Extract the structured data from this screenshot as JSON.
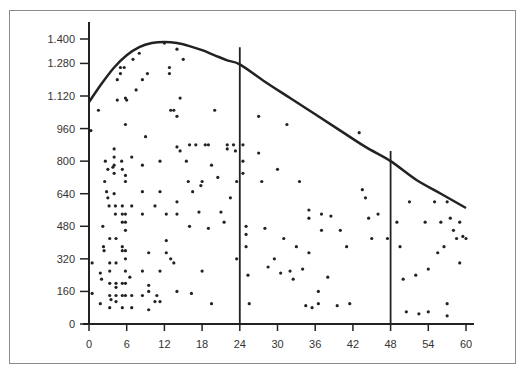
{
  "chart_data": {
    "type": "scatter",
    "title": "",
    "xlabel": "",
    "ylabel": "",
    "xlim": [
      0,
      62
    ],
    "ylim": [
      0,
      1460
    ],
    "grid": false,
    "legend": null,
    "x_ticks": [
      0,
      6,
      12,
      18,
      24,
      30,
      36,
      42,
      48,
      54,
      60
    ],
    "x_tick_labels": [
      "0",
      "6",
      "12",
      "18",
      "24",
      "30",
      "36",
      "42",
      "48",
      "54",
      "60"
    ],
    "y_ticks": [
      0,
      160,
      320,
      480,
      640,
      800,
      960,
      1120,
      1280,
      1400
    ],
    "y_tick_labels": [
      "0",
      "160",
      "320",
      "480",
      "640",
      "800",
      "960",
      "1.120",
      "1.280",
      "1.400"
    ],
    "vertical_lines": [
      {
        "x": 24,
        "y_top": 1360
      },
      {
        "x": 48,
        "y_top": 850
      }
    ],
    "envelope_curve": {
      "name": "upper envelope",
      "x": [
        0,
        2,
        4,
        6,
        8,
        10,
        12,
        14,
        16,
        18,
        20,
        22,
        24,
        28,
        32,
        36,
        40,
        44,
        48,
        52,
        56,
        60
      ],
      "y": [
        1090,
        1180,
        1260,
        1320,
        1360,
        1380,
        1385,
        1380,
        1365,
        1345,
        1320,
        1295,
        1275,
        1190,
        1110,
        1030,
        950,
        870,
        800,
        710,
        640,
        570
      ]
    },
    "points": [
      {
        "x": 0.5,
        "y": 150
      },
      {
        "x": 0.5,
        "y": 300
      },
      {
        "x": 0.3,
        "y": 950
      },
      {
        "x": 1.5,
        "y": 1050
      },
      {
        "x": 1.8,
        "y": 250
      },
      {
        "x": 1.8,
        "y": 100
      },
      {
        "x": 2,
        "y": 220
      },
      {
        "x": 2.2,
        "y": 480
      },
      {
        "x": 2.3,
        "y": 380
      },
      {
        "x": 2.4,
        "y": 360
      },
      {
        "x": 2.5,
        "y": 700
      },
      {
        "x": 2.6,
        "y": 800
      },
      {
        "x": 2.8,
        "y": 650
      },
      {
        "x": 3,
        "y": 760
      },
      {
        "x": 3,
        "y": 620
      },
      {
        "x": 3.2,
        "y": 580
      },
      {
        "x": 3.3,
        "y": 420
      },
      {
        "x": 3.3,
        "y": 300
      },
      {
        "x": 3.3,
        "y": 260
      },
      {
        "x": 3.3,
        "y": 200
      },
      {
        "x": 3.3,
        "y": 140
      },
      {
        "x": 3.3,
        "y": 80
      },
      {
        "x": 3.5,
        "y": 120
      },
      {
        "x": 3.8,
        "y": 770
      },
      {
        "x": 4,
        "y": 860
      },
      {
        "x": 4,
        "y": 820
      },
      {
        "x": 4,
        "y": 780
      },
      {
        "x": 4,
        "y": 740
      },
      {
        "x": 4,
        "y": 640
      },
      {
        "x": 4.2,
        "y": 580
      },
      {
        "x": 4.2,
        "y": 540
      },
      {
        "x": 4.3,
        "y": 420
      },
      {
        "x": 4.3,
        "y": 300
      },
      {
        "x": 4.3,
        "y": 200
      },
      {
        "x": 4.3,
        "y": 180
      },
      {
        "x": 4.3,
        "y": 140
      },
      {
        "x": 4.3,
        "y": 110
      },
      {
        "x": 4.5,
        "y": 1100
      },
      {
        "x": 4.5,
        "y": 1200
      },
      {
        "x": 5,
        "y": 1230
      },
      {
        "x": 5,
        "y": 1260
      },
      {
        "x": 5.2,
        "y": 800
      },
      {
        "x": 5.3,
        "y": 760
      },
      {
        "x": 5.3,
        "y": 580
      },
      {
        "x": 5.3,
        "y": 540
      },
      {
        "x": 5.3,
        "y": 500
      },
      {
        "x": 5.3,
        "y": 380
      },
      {
        "x": 5.3,
        "y": 360
      },
      {
        "x": 5.3,
        "y": 200
      },
      {
        "x": 5.3,
        "y": 140
      },
      {
        "x": 5.3,
        "y": 80
      },
      {
        "x": 5.6,
        "y": 1260
      },
      {
        "x": 5.8,
        "y": 1110
      },
      {
        "x": 5.8,
        "y": 980
      },
      {
        "x": 5.8,
        "y": 730
      },
      {
        "x": 5.8,
        "y": 700
      },
      {
        "x": 5.8,
        "y": 540
      },
      {
        "x": 5.8,
        "y": 500
      },
      {
        "x": 5.8,
        "y": 460
      },
      {
        "x": 5.8,
        "y": 360
      },
      {
        "x": 5.8,
        "y": 320
      },
      {
        "x": 5.8,
        "y": 260
      },
      {
        "x": 5.8,
        "y": 200
      },
      {
        "x": 5.8,
        "y": 140
      },
      {
        "x": 6,
        "y": 1100
      },
      {
        "x": 6.5,
        "y": 230
      },
      {
        "x": 6.8,
        "y": 820
      },
      {
        "x": 6.8,
        "y": 580
      },
      {
        "x": 6.8,
        "y": 80
      },
      {
        "x": 6.8,
        "y": 140
      },
      {
        "x": 7,
        "y": 1300
      },
      {
        "x": 7.5,
        "y": 1150
      },
      {
        "x": 8,
        "y": 1330
      },
      {
        "x": 8.5,
        "y": 1200
      },
      {
        "x": 8.5,
        "y": 780
      },
      {
        "x": 8.5,
        "y": 650
      },
      {
        "x": 8.5,
        "y": 540
      },
      {
        "x": 8.5,
        "y": 260
      },
      {
        "x": 8.5,
        "y": 140
      },
      {
        "x": 9,
        "y": 920
      },
      {
        "x": 9.3,
        "y": 1230
      },
      {
        "x": 9.5,
        "y": 350
      },
      {
        "x": 9.5,
        "y": 190
      },
      {
        "x": 9.5,
        "y": 160
      },
      {
        "x": 9.5,
        "y": 70
      },
      {
        "x": 10.5,
        "y": 580
      },
      {
        "x": 10.5,
        "y": 110
      },
      {
        "x": 10.8,
        "y": 140
      },
      {
        "x": 11.3,
        "y": 800
      },
      {
        "x": 11.3,
        "y": 650
      },
      {
        "x": 11.3,
        "y": 260
      },
      {
        "x": 11.3,
        "y": 110
      },
      {
        "x": 12,
        "y": 1380
      },
      {
        "x": 12.3,
        "y": 540
      },
      {
        "x": 12.3,
        "y": 410
      },
      {
        "x": 12.3,
        "y": 350
      },
      {
        "x": 12.8,
        "y": 1260
      },
      {
        "x": 12.8,
        "y": 1230
      },
      {
        "x": 13,
        "y": 1050
      },
      {
        "x": 13,
        "y": 320
      },
      {
        "x": 13.5,
        "y": 1050
      },
      {
        "x": 13.5,
        "y": 300
      },
      {
        "x": 14,
        "y": 1350
      },
      {
        "x": 14,
        "y": 1020
      },
      {
        "x": 14,
        "y": 870
      },
      {
        "x": 14,
        "y": 600
      },
      {
        "x": 14,
        "y": 540
      },
      {
        "x": 14,
        "y": 160
      },
      {
        "x": 14.5,
        "y": 1110
      },
      {
        "x": 14.5,
        "y": 850
      },
      {
        "x": 15,
        "y": 1300
      },
      {
        "x": 15.5,
        "y": 800
      },
      {
        "x": 15.8,
        "y": 700
      },
      {
        "x": 16,
        "y": 880
      },
      {
        "x": 16,
        "y": 480
      },
      {
        "x": 16.3,
        "y": 150
      },
      {
        "x": 16.5,
        "y": 650
      },
      {
        "x": 17,
        "y": 880
      },
      {
        "x": 17.5,
        "y": 550
      },
      {
        "x": 17.8,
        "y": 680
      },
      {
        "x": 18,
        "y": 700
      },
      {
        "x": 18,
        "y": 260
      },
      {
        "x": 18.5,
        "y": 880
      },
      {
        "x": 19,
        "y": 880
      },
      {
        "x": 19,
        "y": 470
      },
      {
        "x": 19.5,
        "y": 780
      },
      {
        "x": 19.5,
        "y": 100
      },
      {
        "x": 20,
        "y": 1050
      },
      {
        "x": 20.5,
        "y": 720
      },
      {
        "x": 21,
        "y": 550
      },
      {
        "x": 21.5,
        "y": 500
      },
      {
        "x": 22,
        "y": 880
      },
      {
        "x": 22,
        "y": 860
      },
      {
        "x": 22.5,
        "y": 620
      },
      {
        "x": 23,
        "y": 880
      },
      {
        "x": 23.3,
        "y": 850
      },
      {
        "x": 23.5,
        "y": 700
      },
      {
        "x": 23.5,
        "y": 320
      },
      {
        "x": 24.5,
        "y": 880
      },
      {
        "x": 24.5,
        "y": 800
      },
      {
        "x": 24.5,
        "y": 740
      },
      {
        "x": 25,
        "y": 480
      },
      {
        "x": 25,
        "y": 440
      },
      {
        "x": 25,
        "y": 380
      },
      {
        "x": 25.3,
        "y": 240
      },
      {
        "x": 25.5,
        "y": 100
      },
      {
        "x": 27,
        "y": 1020
      },
      {
        "x": 27,
        "y": 840
      },
      {
        "x": 27.5,
        "y": 700
      },
      {
        "x": 28,
        "y": 470
      },
      {
        "x": 28.5,
        "y": 280
      },
      {
        "x": 29.5,
        "y": 320
      },
      {
        "x": 30,
        "y": 760
      },
      {
        "x": 30.5,
        "y": 250
      },
      {
        "x": 31,
        "y": 420
      },
      {
        "x": 31.5,
        "y": 980
      },
      {
        "x": 32,
        "y": 260
      },
      {
        "x": 32.5,
        "y": 220
      },
      {
        "x": 33,
        "y": 380
      },
      {
        "x": 33.5,
        "y": 700
      },
      {
        "x": 34,
        "y": 270
      },
      {
        "x": 34.5,
        "y": 90
      },
      {
        "x": 35,
        "y": 560
      },
      {
        "x": 35,
        "y": 520
      },
      {
        "x": 35,
        "y": 350
      },
      {
        "x": 35.5,
        "y": 80
      },
      {
        "x": 36.5,
        "y": 100
      },
      {
        "x": 36.5,
        "y": 160
      },
      {
        "x": 37,
        "y": 540
      },
      {
        "x": 37,
        "y": 460
      },
      {
        "x": 38,
        "y": 230
      },
      {
        "x": 38.5,
        "y": 530
      },
      {
        "x": 39.5,
        "y": 90
      },
      {
        "x": 40,
        "y": 460
      },
      {
        "x": 41,
        "y": 380
      },
      {
        "x": 41.5,
        "y": 100
      },
      {
        "x": 43,
        "y": 940
      },
      {
        "x": 43.5,
        "y": 660
      },
      {
        "x": 44,
        "y": 620
      },
      {
        "x": 44.5,
        "y": 520
      },
      {
        "x": 45,
        "y": 420
      },
      {
        "x": 46,
        "y": 540
      },
      {
        "x": 47.5,
        "y": 420
      },
      {
        "x": 49,
        "y": 500
      },
      {
        "x": 49.5,
        "y": 380
      },
      {
        "x": 50,
        "y": 220
      },
      {
        "x": 50.5,
        "y": 60
      },
      {
        "x": 51,
        "y": 600
      },
      {
        "x": 52,
        "y": 240
      },
      {
        "x": 52.5,
        "y": 50
      },
      {
        "x": 53.5,
        "y": 500
      },
      {
        "x": 54,
        "y": 270
      },
      {
        "x": 54,
        "y": 60
      },
      {
        "x": 55,
        "y": 600
      },
      {
        "x": 55.5,
        "y": 350
      },
      {
        "x": 56,
        "y": 500
      },
      {
        "x": 56.5,
        "y": 380
      },
      {
        "x": 57,
        "y": 600
      },
      {
        "x": 57,
        "y": 100
      },
      {
        "x": 57.5,
        "y": 520
      },
      {
        "x": 58,
        "y": 460
      },
      {
        "x": 58.5,
        "y": 420
      },
      {
        "x": 59,
        "y": 500
      },
      {
        "x": 59,
        "y": 300
      },
      {
        "x": 59.5,
        "y": 430
      },
      {
        "x": 60,
        "y": 420
      },
      {
        "x": 57,
        "y": 40
      }
    ]
  },
  "colors": {
    "ink": "#222222",
    "frame": "#8a8a8a",
    "label": "#333333",
    "background": "#ffffff"
  }
}
